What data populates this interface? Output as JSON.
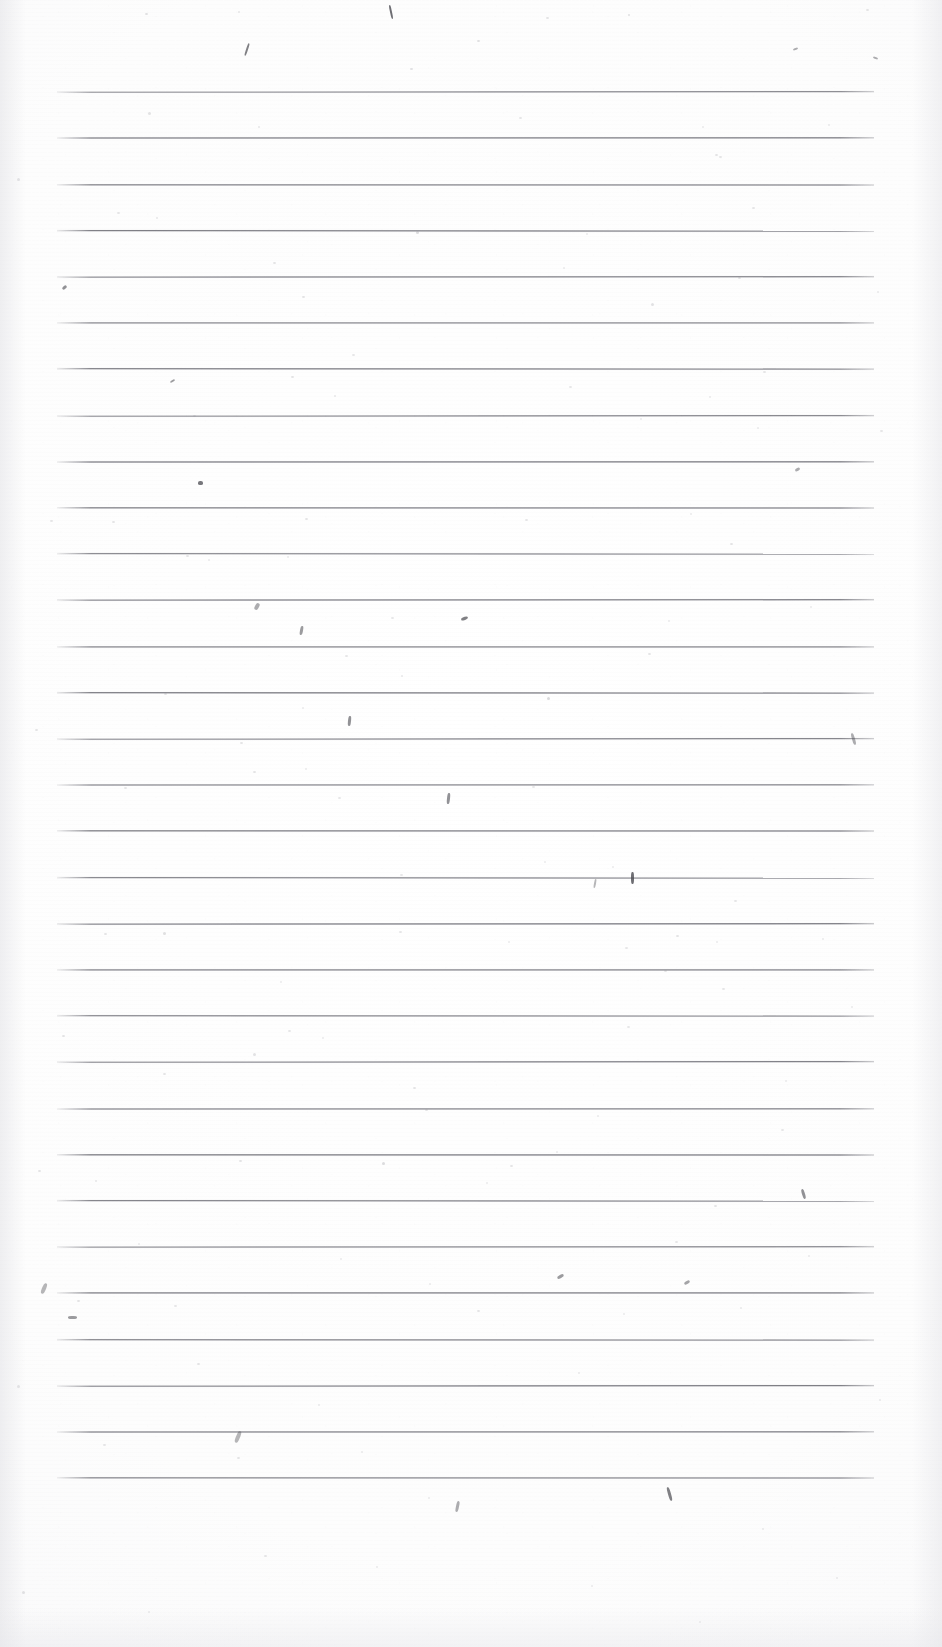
{
  "document": {
    "type": "scanned-lined-paper",
    "title": "Blank ruled notebook page (scan)",
    "text_content": "",
    "handwriting_present": false,
    "printed_text_present": false,
    "page_number_visible": false
  },
  "page": {
    "width_px": 942,
    "height_px": 1647,
    "background_color": "#fdfdfd",
    "orientation": "portrait"
  },
  "ruling": {
    "line_color": "#68686f",
    "line_thickness_px": 2,
    "line_count": 31,
    "first_line_y_px": 91,
    "line_spacing_px": 46.3,
    "line_left_x_px": 57,
    "line_right_x_px": 874,
    "line_length_px": 817,
    "margin_top_px": 91,
    "margin_bottom_px": 167,
    "margin_left_px": 57,
    "margin_right_px": 68,
    "vertical_margin_rule": false,
    "lines_y": [
      91,
      137,
      184,
      230,
      276,
      322,
      368,
      415,
      461,
      507,
      553,
      599,
      646,
      692,
      738,
      784,
      830,
      877,
      923,
      969,
      1015,
      1061,
      1108,
      1154,
      1200,
      1246,
      1292,
      1339,
      1385,
      1431,
      1477
    ]
  },
  "artifacts": {
    "description": "scanner dust specks and ink flecks on otherwise blank paper",
    "specks": [
      {
        "x": 145,
        "y": 13,
        "w": 3,
        "h": 2,
        "o": 0.3
      },
      {
        "x": 238,
        "y": 11,
        "w": 2,
        "h": 2,
        "o": 0.22
      },
      {
        "x": 546,
        "y": 17,
        "w": 3,
        "h": 2,
        "o": 0.26
      },
      {
        "x": 628,
        "y": 14,
        "w": 2,
        "h": 2,
        "o": 0.3
      },
      {
        "x": 866,
        "y": 9,
        "w": 3,
        "h": 2,
        "o": 0.25
      },
      {
        "x": 410,
        "y": 68,
        "w": 3,
        "h": 2,
        "o": 0.28
      },
      {
        "x": 477,
        "y": 40,
        "w": 3,
        "h": 2,
        "o": 0.3
      },
      {
        "x": 719,
        "y": 156,
        "w": 3,
        "h": 2,
        "o": 0.24
      },
      {
        "x": 148,
        "y": 112,
        "w": 3,
        "h": 3,
        "o": 0.26
      },
      {
        "x": 258,
        "y": 126,
        "w": 2,
        "h": 2,
        "o": 0.22
      },
      {
        "x": 519,
        "y": 117,
        "w": 3,
        "h": 2,
        "o": 0.24
      },
      {
        "x": 702,
        "y": 126,
        "w": 2,
        "h": 2,
        "o": 0.2
      },
      {
        "x": 828,
        "y": 124,
        "w": 2,
        "h": 2,
        "o": 0.2
      },
      {
        "x": 17,
        "y": 178,
        "w": 3,
        "h": 3,
        "o": 0.28
      },
      {
        "x": 117,
        "y": 212,
        "w": 3,
        "h": 2,
        "o": 0.24
      },
      {
        "x": 156,
        "y": 217,
        "w": 2,
        "h": 2,
        "o": 0.22
      },
      {
        "x": 416,
        "y": 231,
        "w": 3,
        "h": 3,
        "o": 0.34
      },
      {
        "x": 586,
        "y": 233,
        "w": 2,
        "h": 2,
        "o": 0.2
      },
      {
        "x": 752,
        "y": 207,
        "w": 3,
        "h": 2,
        "o": 0.24
      },
      {
        "x": 273,
        "y": 262,
        "w": 3,
        "h": 2,
        "o": 0.26
      },
      {
        "x": 563,
        "y": 267,
        "w": 2,
        "h": 2,
        "o": 0.2
      },
      {
        "x": 738,
        "y": 277,
        "w": 3,
        "h": 2,
        "o": 0.26
      },
      {
        "x": 715,
        "y": 154,
        "w": 3,
        "h": 2,
        "o": 0.26
      },
      {
        "x": 302,
        "y": 296,
        "w": 3,
        "h": 2,
        "o": 0.26
      },
      {
        "x": 651,
        "y": 303,
        "w": 3,
        "h": 3,
        "o": 0.28
      },
      {
        "x": 877,
        "y": 291,
        "w": 2,
        "h": 2,
        "o": 0.2
      },
      {
        "x": 352,
        "y": 354,
        "w": 3,
        "h": 2,
        "o": 0.24
      },
      {
        "x": 291,
        "y": 376,
        "w": 3,
        "h": 2,
        "o": 0.26
      },
      {
        "x": 569,
        "y": 386,
        "w": 3,
        "h": 2,
        "o": 0.24
      },
      {
        "x": 334,
        "y": 395,
        "w": 2,
        "h": 2,
        "o": 0.22
      },
      {
        "x": 709,
        "y": 396,
        "w": 2,
        "h": 2,
        "o": 0.2
      },
      {
        "x": 763,
        "y": 371,
        "w": 3,
        "h": 2,
        "o": 0.24
      },
      {
        "x": 193,
        "y": 415,
        "w": 3,
        "h": 2,
        "o": 0.26
      },
      {
        "x": 640,
        "y": 418,
        "w": 2,
        "h": 2,
        "o": 0.2
      },
      {
        "x": 757,
        "y": 427,
        "w": 2,
        "h": 2,
        "o": 0.2
      },
      {
        "x": 880,
        "y": 430,
        "w": 3,
        "h": 2,
        "o": 0.24
      },
      {
        "x": 50,
        "y": 520,
        "w": 3,
        "h": 2,
        "o": 0.24
      },
      {
        "x": 112,
        "y": 521,
        "w": 3,
        "h": 2,
        "o": 0.26
      },
      {
        "x": 305,
        "y": 518,
        "w": 3,
        "h": 2,
        "o": 0.26
      },
      {
        "x": 525,
        "y": 519,
        "w": 3,
        "h": 2,
        "o": 0.24
      },
      {
        "x": 690,
        "y": 513,
        "w": 2,
        "h": 2,
        "o": 0.2
      },
      {
        "x": 186,
        "y": 555,
        "w": 3,
        "h": 2,
        "o": 0.24
      },
      {
        "x": 208,
        "y": 559,
        "w": 2,
        "h": 2,
        "o": 0.2
      },
      {
        "x": 287,
        "y": 556,
        "w": 2,
        "h": 2,
        "o": 0.2
      },
      {
        "x": 730,
        "y": 543,
        "w": 3,
        "h": 2,
        "o": 0.26
      },
      {
        "x": 391,
        "y": 617,
        "w": 3,
        "h": 2,
        "o": 0.24
      },
      {
        "x": 668,
        "y": 620,
        "w": 2,
        "h": 2,
        "o": 0.2
      },
      {
        "x": 810,
        "y": 606,
        "w": 2,
        "h": 2,
        "o": 0.2
      },
      {
        "x": 345,
        "y": 655,
        "w": 3,
        "h": 2,
        "o": 0.24
      },
      {
        "x": 648,
        "y": 653,
        "w": 3,
        "h": 2,
        "o": 0.26
      },
      {
        "x": 401,
        "y": 675,
        "w": 2,
        "h": 2,
        "o": 0.22
      },
      {
        "x": 164,
        "y": 693,
        "w": 3,
        "h": 2,
        "o": 0.26
      },
      {
        "x": 302,
        "y": 707,
        "w": 2,
        "h": 2,
        "o": 0.2
      },
      {
        "x": 547,
        "y": 697,
        "w": 3,
        "h": 3,
        "o": 0.36
      },
      {
        "x": 35,
        "y": 729,
        "w": 3,
        "h": 2,
        "o": 0.26
      },
      {
        "x": 240,
        "y": 742,
        "w": 3,
        "h": 2,
        "o": 0.26
      },
      {
        "x": 253,
        "y": 771,
        "w": 3,
        "h": 2,
        "o": 0.26
      },
      {
        "x": 305,
        "y": 768,
        "w": 2,
        "h": 2,
        "o": 0.2
      },
      {
        "x": 124,
        "y": 787,
        "w": 3,
        "h": 2,
        "o": 0.24
      },
      {
        "x": 338,
        "y": 797,
        "w": 3,
        "h": 2,
        "o": 0.24
      },
      {
        "x": 532,
        "y": 786,
        "w": 3,
        "h": 2,
        "o": 0.24
      },
      {
        "x": 400,
        "y": 874,
        "w": 3,
        "h": 2,
        "o": 0.24
      },
      {
        "x": 544,
        "y": 861,
        "w": 2,
        "h": 2,
        "o": 0.2
      },
      {
        "x": 612,
        "y": 866,
        "w": 2,
        "h": 2,
        "o": 0.2
      },
      {
        "x": 734,
        "y": 900,
        "w": 3,
        "h": 2,
        "o": 0.24
      },
      {
        "x": 104,
        "y": 933,
        "w": 3,
        "h": 2,
        "o": 0.26
      },
      {
        "x": 163,
        "y": 932,
        "w": 3,
        "h": 3,
        "o": 0.3
      },
      {
        "x": 399,
        "y": 931,
        "w": 3,
        "h": 2,
        "o": 0.24
      },
      {
        "x": 508,
        "y": 941,
        "w": 2,
        "h": 2,
        "o": 0.2
      },
      {
        "x": 625,
        "y": 947,
        "w": 3,
        "h": 2,
        "o": 0.24
      },
      {
        "x": 676,
        "y": 935,
        "w": 3,
        "h": 2,
        "o": 0.26
      },
      {
        "x": 716,
        "y": 941,
        "w": 2,
        "h": 2,
        "o": 0.2
      },
      {
        "x": 822,
        "y": 938,
        "w": 2,
        "h": 2,
        "o": 0.2
      },
      {
        "x": 664,
        "y": 970,
        "w": 3,
        "h": 2,
        "o": 0.26
      },
      {
        "x": 280,
        "y": 981,
        "w": 2,
        "h": 2,
        "o": 0.2
      },
      {
        "x": 722,
        "y": 988,
        "w": 3,
        "h": 2,
        "o": 0.24
      },
      {
        "x": 851,
        "y": 1006,
        "w": 2,
        "h": 2,
        "o": 0.2
      },
      {
        "x": 62,
        "y": 1035,
        "w": 3,
        "h": 2,
        "o": 0.26
      },
      {
        "x": 288,
        "y": 1030,
        "w": 3,
        "h": 2,
        "o": 0.24
      },
      {
        "x": 322,
        "y": 1037,
        "w": 2,
        "h": 2,
        "o": 0.2
      },
      {
        "x": 627,
        "y": 1026,
        "w": 3,
        "h": 2,
        "o": 0.24
      },
      {
        "x": 253,
        "y": 1053,
        "w": 3,
        "h": 3,
        "o": 0.28
      },
      {
        "x": 163,
        "y": 1073,
        "w": 3,
        "h": 2,
        "o": 0.26
      },
      {
        "x": 413,
        "y": 1087,
        "w": 3,
        "h": 2,
        "o": 0.26
      },
      {
        "x": 785,
        "y": 1080,
        "w": 2,
        "h": 2,
        "o": 0.2
      },
      {
        "x": 425,
        "y": 1109,
        "w": 3,
        "h": 2,
        "o": 0.26
      },
      {
        "x": 597,
        "y": 1115,
        "w": 2,
        "h": 2,
        "o": 0.2
      },
      {
        "x": 781,
        "y": 1129,
        "w": 3,
        "h": 2,
        "o": 0.24
      },
      {
        "x": 38,
        "y": 1170,
        "w": 3,
        "h": 2,
        "o": 0.26
      },
      {
        "x": 95,
        "y": 1180,
        "w": 2,
        "h": 2,
        "o": 0.22
      },
      {
        "x": 239,
        "y": 1160,
        "w": 3,
        "h": 2,
        "o": 0.26
      },
      {
        "x": 382,
        "y": 1162,
        "w": 3,
        "h": 3,
        "o": 0.34
      },
      {
        "x": 510,
        "y": 1165,
        "w": 3,
        "h": 2,
        "o": 0.26
      },
      {
        "x": 556,
        "y": 1151,
        "w": 2,
        "h": 2,
        "o": 0.2
      },
      {
        "x": 486,
        "y": 1182,
        "w": 2,
        "h": 2,
        "o": 0.2
      },
      {
        "x": 714,
        "y": 1205,
        "w": 3,
        "h": 2,
        "o": 0.26
      },
      {
        "x": 138,
        "y": 1243,
        "w": 2,
        "h": 2,
        "o": 0.2
      },
      {
        "x": 675,
        "y": 1241,
        "w": 3,
        "h": 2,
        "o": 0.24
      },
      {
        "x": 808,
        "y": 1255,
        "w": 2,
        "h": 2,
        "o": 0.2
      },
      {
        "x": 340,
        "y": 1258,
        "w": 2,
        "h": 2,
        "o": 0.2
      },
      {
        "x": 429,
        "y": 1283,
        "w": 2,
        "h": 2,
        "o": 0.2
      },
      {
        "x": 77,
        "y": 1300,
        "w": 3,
        "h": 2,
        "o": 0.26
      },
      {
        "x": 174,
        "y": 1305,
        "w": 3,
        "h": 2,
        "o": 0.24
      },
      {
        "x": 477,
        "y": 1310,
        "w": 3,
        "h": 2,
        "o": 0.26
      },
      {
        "x": 623,
        "y": 1313,
        "w": 2,
        "h": 2,
        "o": 0.2
      },
      {
        "x": 740,
        "y": 1307,
        "w": 2,
        "h": 2,
        "o": 0.2
      },
      {
        "x": 197,
        "y": 1363,
        "w": 3,
        "h": 2,
        "o": 0.26
      },
      {
        "x": 578,
        "y": 1372,
        "w": 2,
        "h": 2,
        "o": 0.2
      },
      {
        "x": 17,
        "y": 1385,
        "w": 3,
        "h": 3,
        "o": 0.28
      },
      {
        "x": 318,
        "y": 1404,
        "w": 2,
        "h": 2,
        "o": 0.2
      },
      {
        "x": 879,
        "y": 1399,
        "w": 2,
        "h": 2,
        "o": 0.2
      },
      {
        "x": 103,
        "y": 1444,
        "w": 3,
        "h": 2,
        "o": 0.24
      },
      {
        "x": 237,
        "y": 1457,
        "w": 3,
        "h": 2,
        "o": 0.26
      },
      {
        "x": 361,
        "y": 1451,
        "w": 2,
        "h": 2,
        "o": 0.2
      },
      {
        "x": 428,
        "y": 1497,
        "w": 2,
        "h": 2,
        "o": 0.2
      },
      {
        "x": 762,
        "y": 1528,
        "w": 2,
        "h": 2,
        "o": 0.2
      },
      {
        "x": 264,
        "y": 1555,
        "w": 3,
        "h": 2,
        "o": 0.24
      },
      {
        "x": 376,
        "y": 1566,
        "w": 2,
        "h": 2,
        "o": 0.2
      },
      {
        "x": 591,
        "y": 1585,
        "w": 2,
        "h": 2,
        "o": 0.2
      },
      {
        "x": 836,
        "y": 1577,
        "w": 2,
        "h": 2,
        "o": 0.2
      },
      {
        "x": 22,
        "y": 1591,
        "w": 3,
        "h": 3,
        "o": 0.28
      },
      {
        "x": 148,
        "y": 1611,
        "w": 2,
        "h": 2,
        "o": 0.2
      },
      {
        "x": 699,
        "y": 1621,
        "w": 2,
        "h": 2,
        "o": 0.2
      }
    ],
    "streaks": [
      {
        "x": 390,
        "y": 5,
        "w": 2,
        "h": 14,
        "r": -12,
        "o": 0.8
      },
      {
        "x": 246,
        "y": 43,
        "w": 2,
        "h": 13,
        "r": 18,
        "o": 0.7
      },
      {
        "x": 793,
        "y": 48,
        "w": 5,
        "h": 2,
        "r": -22,
        "o": 0.45
      },
      {
        "x": 873,
        "y": 57,
        "w": 5,
        "h": 2,
        "r": 20,
        "o": 0.45
      },
      {
        "x": 62,
        "y": 286,
        "w": 5,
        "h": 3,
        "r": -38,
        "o": 0.6
      },
      {
        "x": 170,
        "y": 380,
        "w": 5,
        "h": 2,
        "r": -30,
        "o": 0.55
      },
      {
        "x": 198,
        "y": 481,
        "w": 5,
        "h": 4,
        "r": 0,
        "o": 0.75
      },
      {
        "x": 795,
        "y": 468,
        "w": 5,
        "h": 3,
        "r": -28,
        "o": 0.45
      },
      {
        "x": 255,
        "y": 603,
        "w": 4,
        "h": 7,
        "r": 28,
        "o": 0.45
      },
      {
        "x": 300,
        "y": 626,
        "w": 3,
        "h": 9,
        "r": 10,
        "o": 0.55
      },
      {
        "x": 461,
        "y": 617,
        "w": 7,
        "h": 3,
        "r": -20,
        "o": 0.7
      },
      {
        "x": 348,
        "y": 716,
        "w": 3,
        "h": 10,
        "r": 6,
        "o": 0.6
      },
      {
        "x": 852,
        "y": 733,
        "w": 3,
        "h": 12,
        "r": -16,
        "o": 0.45
      },
      {
        "x": 447,
        "y": 793,
        "w": 3,
        "h": 11,
        "r": 6,
        "o": 0.6
      },
      {
        "x": 631,
        "y": 872,
        "w": 3,
        "h": 12,
        "r": 0,
        "o": 0.8
      },
      {
        "x": 594,
        "y": 879,
        "w": 2,
        "h": 9,
        "r": 10,
        "o": 0.4
      },
      {
        "x": 802,
        "y": 1189,
        "w": 3,
        "h": 10,
        "r": -16,
        "o": 0.6
      },
      {
        "x": 557,
        "y": 1275,
        "w": 7,
        "h": 3,
        "r": -30,
        "o": 0.55
      },
      {
        "x": 684,
        "y": 1281,
        "w": 6,
        "h": 3,
        "r": -30,
        "o": 0.5
      },
      {
        "x": 68,
        "y": 1316,
        "w": 9,
        "h": 3,
        "r": 0,
        "o": 0.55
      },
      {
        "x": 42,
        "y": 1283,
        "w": 4,
        "h": 11,
        "r": 22,
        "o": 0.4
      },
      {
        "x": 236,
        "y": 1431,
        "w": 4,
        "h": 12,
        "r": 22,
        "o": 0.4
      },
      {
        "x": 668,
        "y": 1487,
        "w": 3,
        "h": 14,
        "r": -16,
        "o": 0.7
      },
      {
        "x": 456,
        "y": 1501,
        "w": 3,
        "h": 11,
        "r": 12,
        "o": 0.45
      }
    ]
  }
}
